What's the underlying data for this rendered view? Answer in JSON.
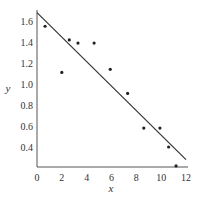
{
  "chart_data": {
    "type": "scatter",
    "title": "",
    "xlabel": "x",
    "ylabel": "y",
    "xlim": [
      0,
      12
    ],
    "ylim": [
      0.22,
      1.7
    ],
    "x_ticks": [
      0,
      2,
      4,
      6,
      8,
      10,
      12
    ],
    "y_ticks": [
      0.4,
      0.6,
      0.8,
      1.0,
      1.2,
      1.4,
      1.6
    ],
    "x_tick_labels": [
      "0",
      "2",
      "4",
      "6",
      "8",
      "10",
      "12"
    ],
    "y_tick_labels": [
      "0.4",
      "0.6",
      "0.8",
      "1.0",
      "1.2",
      "1.4",
      "1.6"
    ],
    "grid": false,
    "legend": null,
    "series": [
      {
        "name": "data",
        "type": "scatter",
        "x": [
          0.65,
          2.0,
          2.6,
          3.3,
          4.6,
          5.9,
          7.3,
          8.6,
          9.9,
          10.6,
          11.2
        ],
        "y": [
          1.55,
          1.11,
          1.42,
          1.39,
          1.39,
          1.14,
          0.91,
          0.58,
          0.58,
          0.4,
          0.22
        ]
      },
      {
        "name": "fit line",
        "type": "line",
        "x": [
          0,
          12
        ],
        "y": [
          1.68,
          0.28
        ]
      }
    ]
  }
}
